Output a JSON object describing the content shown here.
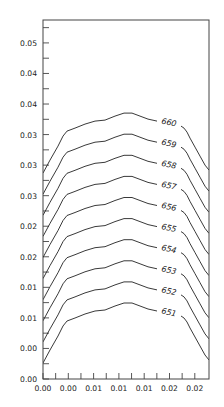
{
  "chart_data": {
    "type": "contour",
    "title": "",
    "xlabel": "",
    "ylabel": "",
    "x_tick_labels": [
      "0.00",
      "0.00",
      "0.01",
      "0.01",
      "0.01",
      "0.02",
      "0.02"
    ],
    "y_tick_labels": [
      "0.00",
      "0.00",
      "0.01",
      "0.01",
      "0.02",
      "0.02",
      "0.03",
      "0.03",
      "0.03",
      "0.04",
      "0.04",
      "0.05"
    ],
    "xlim": [
      0.0,
      0.0245
    ],
    "ylim": [
      0.0,
      0.0575
    ],
    "grid": false,
    "legend": "none",
    "contour_levels": [
      651,
      652,
      653,
      654,
      655,
      656,
      657,
      658,
      659,
      660
    ],
    "contour_labels": [
      "651",
      "652",
      "653",
      "654",
      "655",
      "656",
      "657",
      "658",
      "659",
      "660"
    ],
    "shape_description": "Nested arch-shaped contour lines rising steeply from left edge, gently peaking near x≈0.013, then descending steeply to the right edge; evenly spaced vertically with lowest level (651) at bottom and highest (660) at top."
  }
}
